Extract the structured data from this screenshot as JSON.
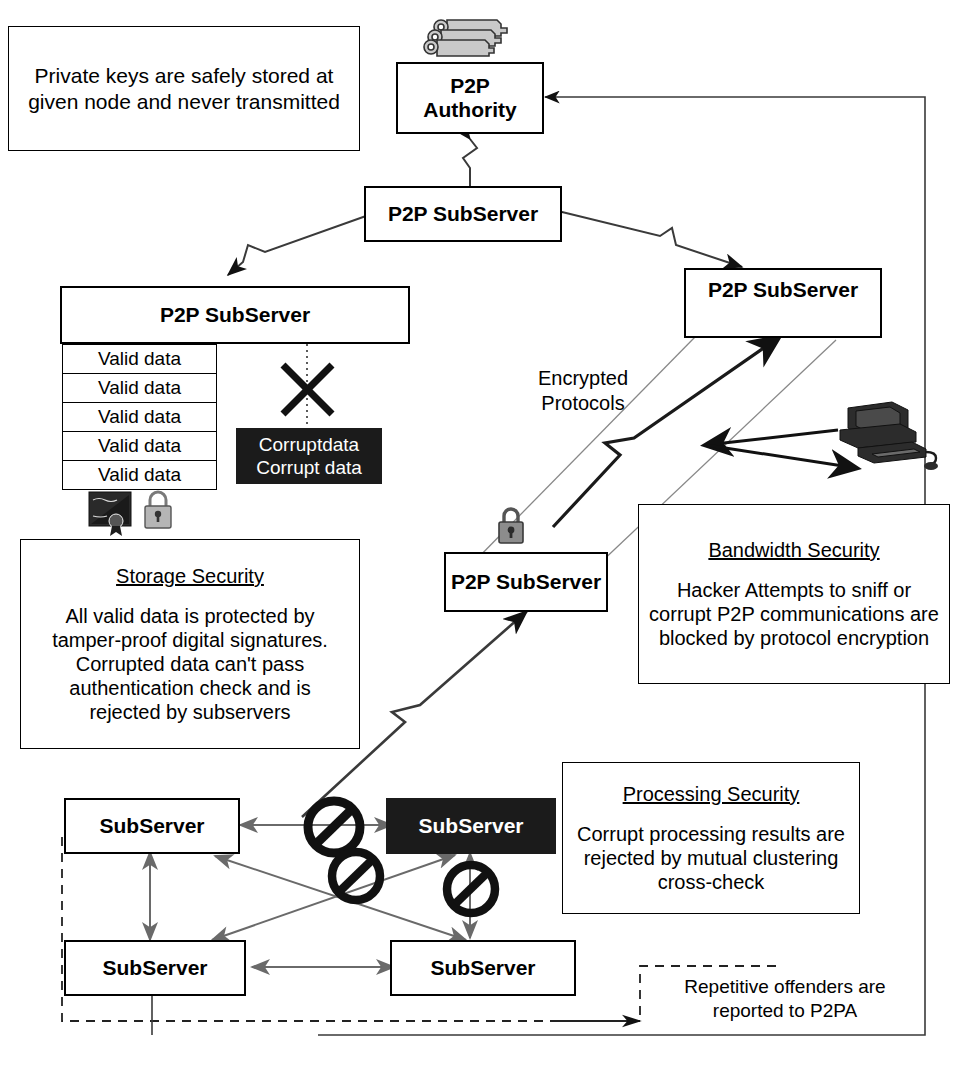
{
  "diagram": {
    "colors": {
      "stroke": "#000000",
      "dark_fill": "#1b1b1b",
      "light_line": "#666666",
      "icon_gray": "#9a9a9a"
    }
  },
  "notes": {
    "private_keys": "Private keys are safely stored at given node and never transmitted",
    "encrypted_protocols": "Encrypted\nProtocols",
    "encrypted_protocols_line1": "Encrypted",
    "encrypted_protocols_line2": "Protocols",
    "repetitive_offenders_line1": "Repetitive offenders are",
    "repetitive_offenders_line2": "reported to P2PA"
  },
  "panels": [
    {
      "id": "storage-security",
      "title": "Storage Security",
      "body": "All valid data is protected by tamper-proof digital signatures. Corrupted data can't pass authentication check and is rejected by subservers"
    },
    {
      "id": "bandwidth-security",
      "title": "Bandwidth Security",
      "body": "Hacker Attempts to sniff or corrupt P2P communications are blocked by protocol encryption"
    },
    {
      "id": "processing-security",
      "title": "Processing Security",
      "body": "Corrupt processing results are rejected by mutual clustering cross-check"
    }
  ],
  "nodes": {
    "authority": {
      "line1": "P2P",
      "line2": "Authority"
    },
    "subserver_top": {
      "label": "P2P SubServer"
    },
    "subserver_left": {
      "label": "P2P SubServer"
    },
    "subserver_right": {
      "label": "P2P SubServer"
    },
    "subserver_mid": {
      "label": "P2P SubServer"
    },
    "cluster": [
      {
        "id": "cluster-a",
        "label": "SubServer",
        "state": "valid"
      },
      {
        "id": "cluster-b",
        "label": "SubServer",
        "state": "corrupt"
      },
      {
        "id": "cluster-c",
        "label": "SubServer",
        "state": "valid"
      },
      {
        "id": "cluster-d",
        "label": "SubServer",
        "state": "valid"
      }
    ]
  },
  "storage": {
    "valid_rows": [
      "Valid data",
      "Valid data",
      "Valid data",
      "Valid data",
      "Valid data"
    ],
    "corrupt_line1": "Corruptdata",
    "corrupt_line2": "Corrupt data"
  },
  "icons": {
    "keyring": "keyring-icon",
    "key": "key-icon",
    "padlock": "padlock-icon",
    "certificate": "certificate-icon",
    "hacker_computer": "hacker-computer-icon",
    "reject_cross": "reject-cross-icon",
    "no_entry": "no-entry-icon"
  }
}
